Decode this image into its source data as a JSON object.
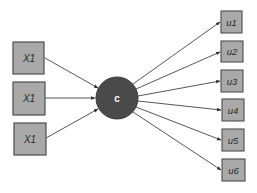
{
  "diagram": {
    "colors": {
      "box_fill": "#a9a9a9",
      "box_stroke": "#4d4d4d",
      "circle_fill": "#4a4a4a",
      "edge": "#444444",
      "label": "#2a2a2a",
      "circle_label": "#ffffff"
    },
    "inputs": [
      {
        "label": "X1"
      },
      {
        "label": "X1"
      },
      {
        "label": "X1"
      }
    ],
    "center": {
      "label": "c"
    },
    "outputs": [
      {
        "label": "u1"
      },
      {
        "label": "u2"
      },
      {
        "label": "u3"
      },
      {
        "label": "u4"
      },
      {
        "label": "u5"
      },
      {
        "label": "u6"
      }
    ]
  }
}
